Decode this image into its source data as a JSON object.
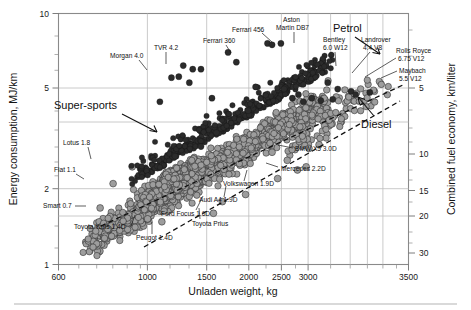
{
  "chart_data": {
    "type": "scatter",
    "title": "",
    "xlabel": "Unladen weight, kg",
    "ylabel": "Energy consumption, MJ/km",
    "y2label": "Combined fuel economy, km/liter",
    "xscale": "log",
    "yscale": "log",
    "xlim": [
      600,
      3500
    ],
    "ylim": [
      1,
      10
    ],
    "xticks": [
      600,
      1000,
      1500,
      2000,
      2500,
      3000,
      3500
    ],
    "xticklabels": [
      "600",
      "1000",
      "1500",
      "2000",
      "2500",
      "3000",
      "3500"
    ],
    "yticks": [
      1,
      2,
      5,
      10
    ],
    "yticklabels": [
      "1",
      "2",
      "5",
      "10"
    ],
    "y2ticks": [
      5,
      10,
      15,
      20,
      30
    ],
    "y2ticklabels": [
      "5",
      "10",
      "15",
      "20",
      "30"
    ],
    "grid": true,
    "legend": "none",
    "series": [
      {
        "name": "Petrol (dark filled markers)",
        "marker": "filled-dark-circle",
        "color": "#2b2b2b"
      },
      {
        "name": "Diesel / mainstream (grey outlined markers)",
        "marker": "grey-circle",
        "color": "#9d9d9d"
      }
    ],
    "trendlines": [
      {
        "name": "Petrol",
        "x": [
          760,
          3450
        ],
        "y": [
          1.62,
          5.55
        ]
      },
      {
        "name": "Diesel",
        "x": [
          980,
          3400
        ],
        "y": [
          1.22,
          4.35
        ]
      }
    ],
    "group_annotations": [
      {
        "label": "Super-sports",
        "x": 760,
        "y": 4.05,
        "target_x": 1075,
        "target_y": 2.75
      },
      {
        "label": "Petrol",
        "x": 2580,
        "y": 8.1,
        "target_x": 2880,
        "target_y": 5.5
      },
      {
        "label": "Diesel",
        "x": 3060,
        "y": 3.35,
        "target_x": 2930,
        "target_y": 4.35
      }
    ],
    "labeled_points": [
      {
        "label": "Morgan 4.0",
        "x": 1000,
        "y": 4.45
      },
      {
        "label": "TVR 4.2",
        "x": 1125,
        "y": 6.2
      },
      {
        "label": "Ferrari 360",
        "x": 1410,
        "y": 7.0
      },
      {
        "label": "Ferrari 456",
        "x": 1720,
        "y": 7.6
      },
      {
        "label": "Aston Martin DB7",
        "x": 1840,
        "y": 7.6
      },
      {
        "label": "Bentley 6.0 W12",
        "x": 2330,
        "y": 5.3
      },
      {
        "label": "Landrover 4.4 V8",
        "x": 2450,
        "y": 5.0
      },
      {
        "label": "Rolls Royce 6.75 V12",
        "x": 2620,
        "y": 4.9
      },
      {
        "label": "Maybach 5.5 V12",
        "x": 2880,
        "y": 4.85
      },
      {
        "label": "Lotus 1.8",
        "x": 870,
        "y": 2.45
      },
      {
        "label": "Fiat 1.1",
        "x": 790,
        "y": 2.1
      },
      {
        "label": "Smart 0.7",
        "x": 740,
        "y": 1.68
      },
      {
        "label": "Toyota Yaris 1.4D",
        "x": 940,
        "y": 1.52
      },
      {
        "label": "Peugot 1.4D",
        "x": 1010,
        "y": 1.48
      },
      {
        "label": "Toyota Prius",
        "x": 1310,
        "y": 1.6
      },
      {
        "label": "Ford Focus 1.6D",
        "x": 1370,
        "y": 1.78
      },
      {
        "label": "Audi A4 1.9D",
        "x": 1540,
        "y": 1.9
      },
      {
        "label": "Volkswagen 1.9D",
        "x": 1810,
        "y": 2.2
      },
      {
        "label": "Mercedes 2.2D",
        "x": 2090,
        "y": 2.45
      },
      {
        "label": "BMW X5 3.0D",
        "x": 2230,
        "y": 3.0
      }
    ]
  },
  "axes": {
    "x_title": "Unladen weight, kg",
    "y_title": "Energy consumption, MJ/km",
    "y2_title": "Combined fuel economy, km/liter"
  }
}
